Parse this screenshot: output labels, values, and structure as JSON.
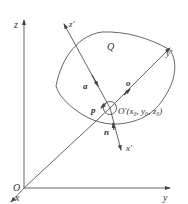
{
  "diagram": {
    "axes": {
      "origin_label": "O",
      "x_label": "x",
      "y_label": "y",
      "z_label": "z"
    },
    "local_axes": {
      "origin_label": "O′(x₀, y₀, z₀)",
      "x_label": "x′",
      "y_label": "y′",
      "z_label": "z′"
    },
    "surface_label": "Q",
    "vectors": {
      "a": "a",
      "o": "o",
      "n": "n",
      "p": "p"
    },
    "colors": {
      "line": "#555555",
      "text": "#333333",
      "background": "#ffffff"
    }
  }
}
